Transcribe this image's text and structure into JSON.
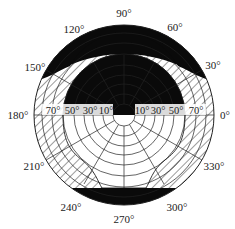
{
  "diagram": {
    "type": "polar sky diagram",
    "center": {
      "x": 124,
      "y": 115
    },
    "outer_radius": 90,
    "azimuth_labels": [
      {
        "text": "90°",
        "x": 124,
        "y": 14
      },
      {
        "text": "60°",
        "x": 175,
        "y": 30
      },
      {
        "text": "120°",
        "x": 73,
        "y": 32
      },
      {
        "text": "30°",
        "x": 213,
        "y": 69
      },
      {
        "text": "150°",
        "x": 36,
        "y": 72
      },
      {
        "text": "0°",
        "x": 224,
        "y": 119
      },
      {
        "text": "180°",
        "x": 22,
        "y": 119
      },
      {
        "text": "330°",
        "x": 213,
        "y": 168
      },
      {
        "text": "210°",
        "x": 34,
        "y": 168
      },
      {
        "text": "300°",
        "x": 177,
        "y": 210
      },
      {
        "text": "240°",
        "x": 72,
        "y": 210
      },
      {
        "text": "270°",
        "x": 124,
        "y": 221
      }
    ],
    "zenith_labels_left": [
      "70°",
      "50°",
      "30°",
      "10°"
    ],
    "zenith_labels_right": [
      "10°",
      "30°",
      "50°",
      "70°"
    ],
    "colors": {
      "line": "#222222",
      "fill_black": "#0a0a0a",
      "background": "#ffffff"
    }
  }
}
